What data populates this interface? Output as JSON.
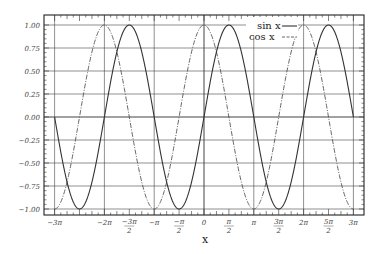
{
  "chart_data": {
    "type": "line",
    "title": "",
    "xlabel": "x",
    "ylabel": "",
    "xlim": [
      -9.4248,
      9.4248
    ],
    "ylim": [
      -1.0,
      1.0
    ],
    "grid": true,
    "legend_position": "upper right (inside)",
    "x_ticks": [
      "-3π",
      "-3π/2",
      "-2π",
      "-π... ",
      "-π",
      "-π/2",
      "0",
      "π/2",
      "π",
      "3π/2",
      "2π",
      "5π/2",
      "3π"
    ],
    "x_tick_labels": [
      {
        "text": "-3π",
        "value": -9.4248
      },
      {
        "text": "-5π/2 (unlabeled)",
        "value": -7.854
      },
      {
        "text": "-2π",
        "value": -6.2832
      },
      {
        "text": "-3π/2",
        "value": -4.7124
      },
      {
        "text": "-π",
        "value": -3.1416
      },
      {
        "text": "-π/2",
        "value": -1.5708
      },
      {
        "text": "0",
        "value": 0
      },
      {
        "text": "π/2",
        "value": 1.5708
      },
      {
        "text": "π",
        "value": 3.1416
      },
      {
        "text": "3π/2",
        "value": 4.7124
      },
      {
        "text": "2π",
        "value": 6.2832
      },
      {
        "text": "5π/2",
        "value": 7.854
      },
      {
        "text": "3π",
        "value": 9.4248
      }
    ],
    "y_tick_labels": [
      "1.00",
      "0.75",
      "0.50",
      "0.25",
      "0.00",
      "-0.25",
      "-0.50",
      "-0.75",
      "-1.00"
    ],
    "series": [
      {
        "name": "sin x",
        "style": "solid",
        "function": "sin",
        "x_range": [
          -9.4248,
          9.4248
        ]
      },
      {
        "name": "cos x",
        "style": "dash-dot",
        "function": "cos",
        "x_range": [
          -9.4248,
          9.4248
        ]
      }
    ]
  },
  "axes": {
    "y_labels": [
      "1.00",
      "0.75",
      "0.50",
      "0.25",
      "0.00",
      "−0.25",
      "−0.50",
      "−0.75",
      "−1.00"
    ],
    "x_labels": [
      {
        "num": "−3π",
        "den": ""
      },
      {
        "num": "−5π",
        "den": "2",
        "hidden": true
      },
      {
        "num": "−2π",
        "den": ""
      },
      {
        "num": "−3π",
        "den": "2"
      },
      {
        "num": "−π",
        "den": ""
      },
      {
        "num": "−π",
        "den": "2"
      },
      {
        "num": "0",
        "den": ""
      },
      {
        "num": "π",
        "den": "2"
      },
      {
        "num": "π",
        "den": ""
      },
      {
        "num": "3π",
        "den": "2"
      },
      {
        "num": "2π",
        "den": ""
      },
      {
        "num": "5π",
        "den": "2"
      },
      {
        "num": "3π",
        "den": ""
      }
    ],
    "x_title": "x"
  },
  "legend": {
    "sin_label": "sin x",
    "cos_label": "cos x"
  },
  "colors": {
    "sin": "#333333",
    "cos": "#555555",
    "grid": "#333333",
    "frame": "#222222"
  }
}
